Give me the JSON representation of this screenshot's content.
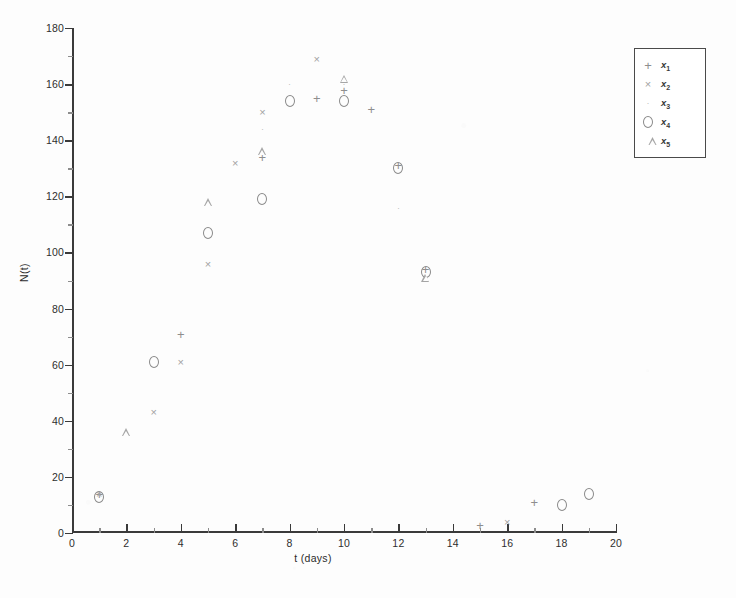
{
  "chart_data": {
    "type": "scatter",
    "title": "",
    "xlabel": "t (days)",
    "ylabel": "N(t)",
    "xlim": [
      0,
      20
    ],
    "ylim": [
      0,
      180
    ],
    "xticks": [
      0,
      2,
      4,
      6,
      8,
      10,
      12,
      14,
      16,
      18,
      20
    ],
    "yticks": [
      0,
      20,
      40,
      60,
      80,
      100,
      120,
      140,
      160,
      180
    ],
    "x_minor_step": 1,
    "y_minor_step": 10,
    "grid": false,
    "legend_position": "top-right",
    "series": [
      {
        "name": "x1",
        "label": "x",
        "subscript": "1",
        "marker": "plus",
        "points": [
          {
            "x": 1,
            "y": 14
          },
          {
            "x": 4,
            "y": 71
          },
          {
            "x": 7,
            "y": 134
          },
          {
            "x": 9,
            "y": 155
          },
          {
            "x": 10,
            "y": 158
          },
          {
            "x": 11,
            "y": 151
          },
          {
            "x": 12,
            "y": 131
          },
          {
            "x": 13,
            "y": 94
          },
          {
            "x": 15,
            "y": 3
          },
          {
            "x": 17,
            "y": 11
          }
        ]
      },
      {
        "name": "x2",
        "label": "x",
        "subscript": "2",
        "marker": "cross",
        "points": [
          {
            "x": 1,
            "y": 14
          },
          {
            "x": 3,
            "y": 43
          },
          {
            "x": 4,
            "y": 61
          },
          {
            "x": 5,
            "y": 96
          },
          {
            "x": 6,
            "y": 132
          },
          {
            "x": 7,
            "y": 150
          },
          {
            "x": 9,
            "y": 169
          },
          {
            "x": 16,
            "y": 4
          }
        ]
      },
      {
        "name": "x3",
        "label": "x",
        "subscript": "3",
        "marker": "dot",
        "points": [
          {
            "x": 7,
            "y": 144
          },
          {
            "x": 8,
            "y": 160
          },
          {
            "x": 10,
            "y": 160
          },
          {
            "x": 12,
            "y": 116
          }
        ]
      },
      {
        "name": "x4",
        "label": "x",
        "subscript": "4",
        "marker": "circle",
        "points": [
          {
            "x": 1,
            "y": 13
          },
          {
            "x": 3,
            "y": 61
          },
          {
            "x": 5,
            "y": 107
          },
          {
            "x": 7,
            "y": 119
          },
          {
            "x": 8,
            "y": 154
          },
          {
            "x": 10,
            "y": 154
          },
          {
            "x": 12,
            "y": 130
          },
          {
            "x": 13,
            "y": 93
          },
          {
            "x": 18,
            "y": 10
          },
          {
            "x": 19,
            "y": 14
          }
        ]
      },
      {
        "name": "x5",
        "label": "x",
        "subscript": "5",
        "marker": "triangle",
        "points": [
          {
            "x": 2,
            "y": 36
          },
          {
            "x": 5,
            "y": 118
          },
          {
            "x": 7,
            "y": 136
          },
          {
            "x": 10,
            "y": 162
          },
          {
            "x": 13,
            "y": 91
          }
        ]
      }
    ]
  },
  "axes": {
    "xlabel": "t (days)",
    "ylabel": "N(t)"
  },
  "legend": {
    "entries": [
      {
        "marker": "plus",
        "label": "x",
        "subscript": "1"
      },
      {
        "marker": "cross",
        "label": "x",
        "subscript": "2"
      },
      {
        "marker": "dot",
        "label": "x",
        "subscript": "3"
      },
      {
        "marker": "circle",
        "label": "x",
        "subscript": "4"
      },
      {
        "marker": "triangle",
        "label": "x",
        "subscript": "5"
      }
    ]
  }
}
